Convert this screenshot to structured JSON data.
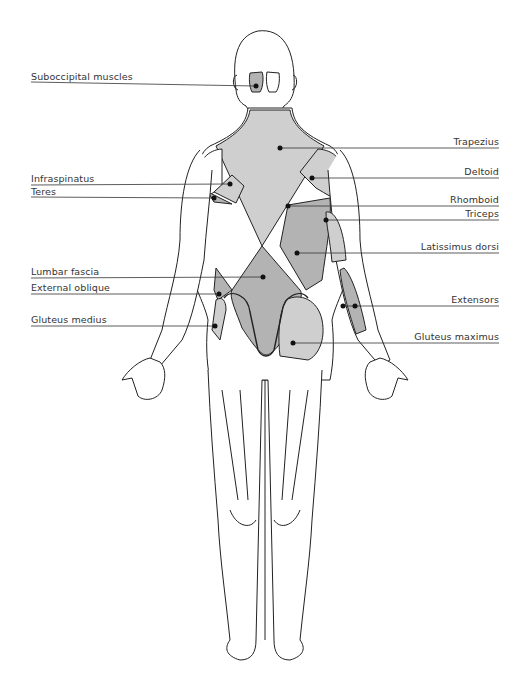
{
  "diagram": {
    "colors": {
      "light_muscle": "#cfcfcf",
      "dark_muscle": "#b3b3b3",
      "outline": "#222222",
      "leader": "#333333",
      "label_text": "#333333"
    },
    "labels_left": [
      {
        "id": "suboccipital",
        "text": "Suboccipital muscles",
        "y": 82
      },
      {
        "id": "infraspinatus",
        "text": "Infraspinatus",
        "y": 180
      },
      {
        "id": "teres",
        "text": "Teres",
        "y": 193
      },
      {
        "id": "lumbar-fascia",
        "text": "Lumbar fascia",
        "y": 273
      },
      {
        "id": "external-oblique",
        "text": "External oblique",
        "y": 289
      },
      {
        "id": "gluteus-medius",
        "text": "Gluteus medius",
        "y": 321
      }
    ],
    "labels_right": [
      {
        "id": "trapezius",
        "text": "Trapezius",
        "y": 143
      },
      {
        "id": "deltoid",
        "text": "Deltoid",
        "y": 172
      },
      {
        "id": "rhomboid",
        "text": "Rhomboid",
        "y": 200
      },
      {
        "id": "triceps",
        "text": "Triceps",
        "y": 214
      },
      {
        "id": "latissimus-dorsi",
        "text": "Latissimus dorsi",
        "y": 248
      },
      {
        "id": "extensors",
        "text": "Extensors",
        "y": 301
      },
      {
        "id": "gluteus-maximus",
        "text": "Gluteus maximus",
        "y": 338
      }
    ]
  }
}
